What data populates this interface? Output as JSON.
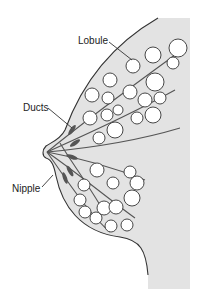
{
  "diagram": {
    "labels": {
      "lobule": "Lobule",
      "ducts": "Ducts",
      "nipple": "Nipple"
    },
    "colors": {
      "tissue_fill": "#e3e3e3",
      "outline": "#333333",
      "duct": "#555555",
      "lobule_fill": "#ffffff"
    }
  }
}
